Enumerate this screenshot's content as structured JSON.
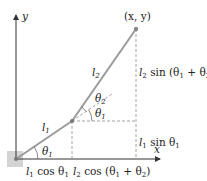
{
  "diagram": {
    "type": "two-link planar robot arm kinematics",
    "colors": {
      "axis": "#333333",
      "link": "#9a9a9a",
      "dashed": "#8a8a8a",
      "base": "#d3d3d3",
      "text": "#222222"
    },
    "axes": {
      "x_label": "x",
      "y_label": "y"
    },
    "points": {
      "end_effector_label": "(x, y)"
    },
    "links": {
      "l1": {
        "name": "l",
        "sub": "1"
      },
      "l2": {
        "name": "l",
        "sub": "2"
      }
    },
    "angles": {
      "theta1_base": {
        "name": "θ",
        "sub": "1"
      },
      "theta1_elbow": {
        "name": "θ",
        "sub": "1"
      },
      "theta2": {
        "name": "θ",
        "sub": "2"
      }
    },
    "projections": {
      "l1_cos": {
        "pre": "l",
        "pre_sub": "1",
        "mid": " cos θ",
        "mid_sub": "1",
        "post": ""
      },
      "l2_cos": {
        "pre": "l",
        "pre_sub": "2",
        "mid": " cos (θ",
        "mid_sub": "1",
        "plus": " + θ",
        "plus_sub": "2",
        "post": ")"
      },
      "l1_sin": {
        "pre": "l",
        "pre_sub": "1",
        "mid": " sin θ",
        "mid_sub": "1",
        "post": ""
      },
      "l2_sin": {
        "pre": "l",
        "pre_sub": "2",
        "mid": " sin (θ",
        "mid_sub": "1",
        "plus": " + θ",
        "plus_sub": "2",
        "post": ")"
      }
    }
  }
}
